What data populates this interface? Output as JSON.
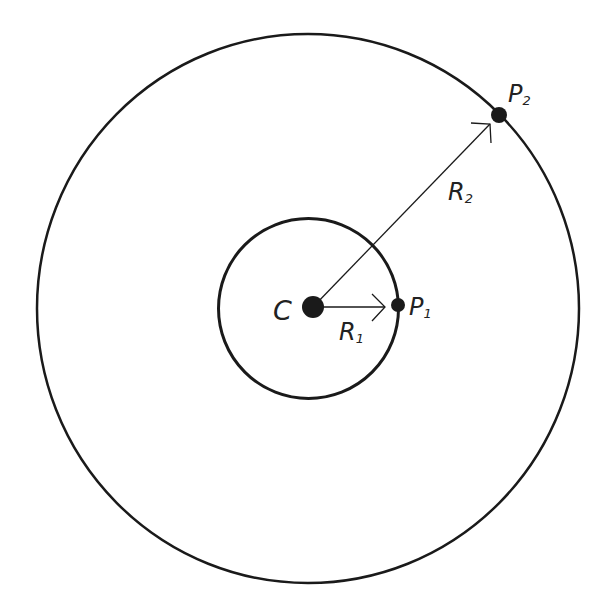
{
  "diagram": {
    "type": "concentric-circles",
    "colors": {
      "stroke": "#1a1a1a",
      "background": "#ffffff",
      "text": "#222222"
    },
    "outer_circle": {
      "cx": 308,
      "cy": 308.5,
      "rx": 271,
      "ry": 274.5,
      "stroke_width": 2.5
    },
    "inner_circle": {
      "cx": 308.5,
      "cy": 308.5,
      "r": 90,
      "stroke_width": 3
    },
    "points": [
      {
        "id": "C",
        "x": 313,
        "y": 307,
        "r": 11
      },
      {
        "id": "P1",
        "x": 398,
        "y": 305,
        "r": 7
      },
      {
        "id": "P2",
        "x": 499,
        "y": 115,
        "r": 8
      }
    ],
    "labels": {
      "center": {
        "main": "C",
        "sub": ""
      },
      "p1": {
        "main": "P",
        "sub": "1"
      },
      "p2": {
        "main": "P",
        "sub": "2"
      },
      "r1": {
        "main": "R",
        "sub": "1"
      },
      "r2": {
        "main": "R",
        "sub": "2"
      }
    },
    "arrows": [
      {
        "name": "R1",
        "from": [
          313,
          307
        ],
        "to": [
          385,
          307
        ]
      },
      {
        "name": "R2",
        "from": [
          313,
          307
        ],
        "to": [
          490,
          124
        ]
      }
    ]
  }
}
